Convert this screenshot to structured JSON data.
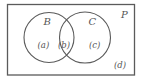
{
  "diagram": {
    "type": "venn",
    "stroke_color": "#5a5a5a",
    "background_color": "#ffffff",
    "universe": {
      "label": "P",
      "rect": {
        "x": 7.5,
        "y": 4.5,
        "width": 127,
        "height": 70.5
      }
    },
    "sets": [
      {
        "label": "B",
        "cx": 49,
        "cy": 37.5,
        "r": 25
      },
      {
        "label": "C",
        "cx": 85,
        "cy": 37.5,
        "r": 25.5
      }
    ],
    "regions": [
      {
        "id": "a",
        "label": "(a)",
        "description": "in B only"
      },
      {
        "id": "b",
        "label": "(b)",
        "description": "in B and C"
      },
      {
        "id": "c",
        "label": "(c)",
        "description": "in C only"
      },
      {
        "id": "d",
        "label": "(d)",
        "description": "in P, outside B and C"
      }
    ]
  }
}
